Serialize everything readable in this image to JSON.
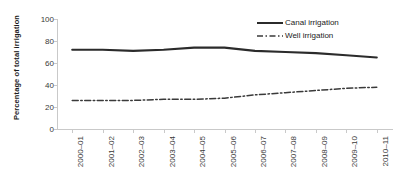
{
  "chart_data": {
    "type": "line",
    "title": "",
    "xlabel": "",
    "ylabel": "Percentage of total irrigation",
    "ylim": [
      0,
      100
    ],
    "yticks": [
      0,
      20,
      40,
      60,
      80,
      100
    ],
    "grid": false,
    "legend_position": "top-right",
    "categories": [
      "2000–01",
      "2001–02",
      "2002–03",
      "2003–04",
      "2004–05",
      "2005–06",
      "2006–07",
      "2007–08",
      "2008–09",
      "2009–10",
      "2010–11"
    ],
    "series": [
      {
        "name": "Canal irrigation",
        "style": "solid",
        "color": "#2b2b2b",
        "values": [
          72,
          72,
          71,
          72,
          74,
          74,
          71,
          70,
          69,
          67,
          65
        ]
      },
      {
        "name": "Well irrigation",
        "style": "dash-dot",
        "color": "#3a3a3a",
        "values": [
          26,
          26,
          26,
          27,
          27,
          28,
          31,
          33,
          35,
          37,
          38
        ]
      }
    ]
  },
  "axes": {
    "y_title": "Percentage of total irrigation"
  },
  "legend": {
    "entries": [
      {
        "label": "Canal irrigation",
        "key": "solid-line-key"
      },
      {
        "label": "Well irrigation",
        "key": "dash-dot-line-key"
      }
    ]
  },
  "colors": {
    "canal": "#2b2b2b",
    "well": "#3a3a3a",
    "axis": "#c9c9c9",
    "text": "#3a3a3a",
    "background": "#ffffff"
  }
}
